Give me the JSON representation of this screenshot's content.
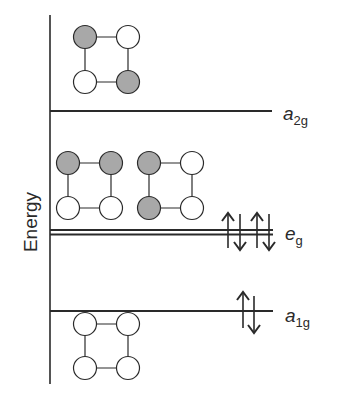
{
  "diagram": {
    "type": "molecular-orbital-energy-diagram",
    "axis_label": "Energy",
    "levels": [
      {
        "id": "a2g",
        "label_main": "a",
        "label_sub": "2g",
        "electrons": 0,
        "orbitals": [
          {
            "shaded": [
              true,
              false,
              false,
              true
            ]
          }
        ]
      },
      {
        "id": "eg",
        "label_main": "e",
        "label_sub": "g",
        "degenerate": true,
        "electrons": 4,
        "orbitals": [
          {
            "shaded": [
              true,
              true,
              false,
              false
            ]
          },
          {
            "shaded": [
              true,
              false,
              true,
              false
            ]
          }
        ]
      },
      {
        "id": "a1g",
        "label_main": "a",
        "label_sub": "1g",
        "electrons": 2,
        "orbitals": [
          {
            "shaded": [
              false,
              false,
              false,
              false
            ]
          }
        ]
      }
    ],
    "colors": {
      "line": "#2a2a2a",
      "shaded_lobe": "#a8a8a8",
      "unshaded_lobe": "#ffffff"
    }
  }
}
